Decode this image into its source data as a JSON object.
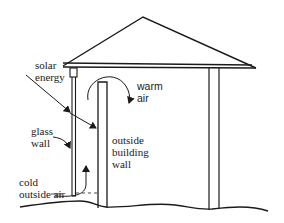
{
  "diagram": {
    "type": "cross-section schematic",
    "colors": {
      "line": "#1a1a1a",
      "background": "#ffffff"
    },
    "labels": {
      "solar_energy": {
        "line1": "solar",
        "line2": "energy"
      },
      "warm_air": {
        "line1": "warm",
        "line2": "air"
      },
      "glass_wall": {
        "line1": "glass",
        "line2": "wall"
      },
      "outside_building_wall": {
        "line1": "outside",
        "line2": "building",
        "line3": "wall"
      },
      "cold_outside_air": {
        "line1": "cold",
        "line2": "outside air"
      }
    },
    "components": [
      "roof",
      "glass-wall",
      "outside-building-wall",
      "right-wall",
      "ground",
      "solar-energy-arrow",
      "warm-air-arrow",
      "cold-air-arrow",
      "glass-wall-pointer",
      "building-wall-pointer"
    ]
  }
}
